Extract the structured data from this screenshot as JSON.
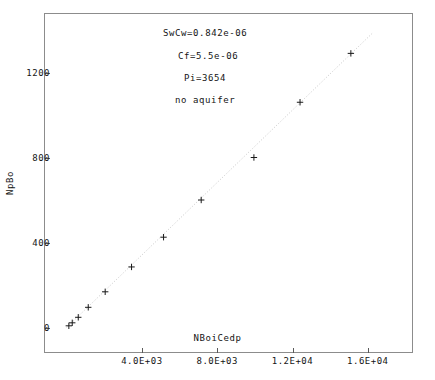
{
  "chart_data": {
    "type": "scatter",
    "title": "",
    "xlabel": "NBoiCedp",
    "ylabel": "NpBo",
    "xlim": [
      -1200,
      18400
    ],
    "ylim": [
      -120,
      1480
    ],
    "grid": false,
    "legend": null,
    "xticks": [
      4000,
      8000,
      12000,
      16000
    ],
    "xticklabels": [
      "4.0E+03",
      "8.0E+03",
      "1.2E+04",
      "1.6E+04"
    ],
    "yticks": [
      0,
      400,
      800,
      1200
    ],
    "yticklabels": [
      "0",
      "400",
      "800",
      "1200"
    ],
    "marker": "+",
    "marker_color": "#1a1a1a",
    "line_color": "#c8c8c8",
    "series": [
      {
        "name": "NpBo vs NBoiCedp",
        "x": [
          120,
          300,
          620,
          1150,
          2050,
          3450,
          5150,
          7150,
          9950,
          12400,
          15100
        ],
        "y": [
          8,
          22,
          48,
          95,
          168,
          285,
          425,
          600,
          800,
          1060,
          1290
        ]
      }
    ],
    "trendline": {
      "x": [
        0,
        16300
      ],
      "y": [
        0,
        1390
      ],
      "style": "dotted",
      "color": "#c8c8c8"
    },
    "annotations": [
      {
        "text": "SwCw=0.842e-06",
        "x_px": 163,
        "y_px": 28
      },
      {
        "text": "Cf=5.5e-06",
        "x_px": 178,
        "y_px": 51
      },
      {
        "text": "Pi=3654",
        "x_px": 184,
        "y_px": 73
      },
      {
        "text": "no aquifer",
        "x_px": 175,
        "y_px": 95
      }
    ]
  }
}
